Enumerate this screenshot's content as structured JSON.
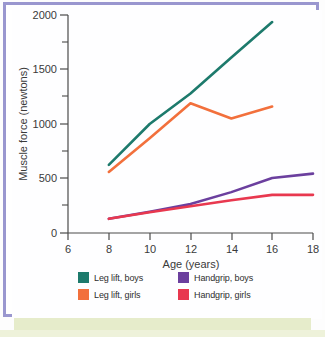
{
  "figure": {
    "border_color": "#9a97cf",
    "background_color": "#ffffff",
    "bottom_strip_color": "#e6eccb"
  },
  "chart_data": {
    "type": "line",
    "title": "",
    "xlabel": "Age (years)",
    "ylabel": "Muscle force (newtons)",
    "xlim": [
      6,
      18
    ],
    "ylim": [
      0,
      2000
    ],
    "xticks": [
      6,
      8,
      10,
      12,
      14,
      16,
      18
    ],
    "yticks": [
      0,
      500,
      1000,
      1500,
      2000
    ],
    "y_minor_ticks": [
      250,
      750,
      1250,
      1750
    ],
    "grid": false,
    "legend_position": "below",
    "series": [
      {
        "name": "Leg lift, boys",
        "color": "#1d7a6c",
        "x": [
          8,
          10,
          12,
          14,
          16
        ],
        "values": [
          625,
          1000,
          1280,
          1610,
          1935
        ]
      },
      {
        "name": "Leg lift, girls",
        "color": "#f2703c",
        "x": [
          8,
          10,
          12,
          14,
          16
        ],
        "values": [
          560,
          870,
          1190,
          1050,
          1160
        ]
      },
      {
        "name": "Handgrip, boys",
        "color": "#6b3f9e",
        "x": [
          8,
          10,
          12,
          14,
          16,
          18
        ],
        "values": [
          130,
          195,
          265,
          375,
          505,
          545
        ]
      },
      {
        "name": "Handgrip, girls",
        "color": "#e8384f",
        "x": [
          8,
          10,
          12,
          14,
          16,
          18
        ],
        "values": [
          130,
          190,
          245,
          300,
          350,
          350
        ]
      }
    ]
  },
  "axis": {
    "xtick_labels": [
      "6",
      "8",
      "10",
      "12",
      "14",
      "16",
      "18"
    ],
    "ytick_labels": [
      "0",
      "500",
      "1000",
      "1500",
      "2000"
    ],
    "x_title": "Age (years)",
    "y_title": "Muscle force (newtons)"
  },
  "legend": {
    "items": [
      {
        "label": "Leg lift, boys",
        "color": "#1d7a6c"
      },
      {
        "label": "Handgrip, boys",
        "color": "#6b3f9e"
      },
      {
        "label": "Leg lift, girls",
        "color": "#f2703c"
      },
      {
        "label": "Handgrip, girls",
        "color": "#e8384f"
      }
    ]
  }
}
